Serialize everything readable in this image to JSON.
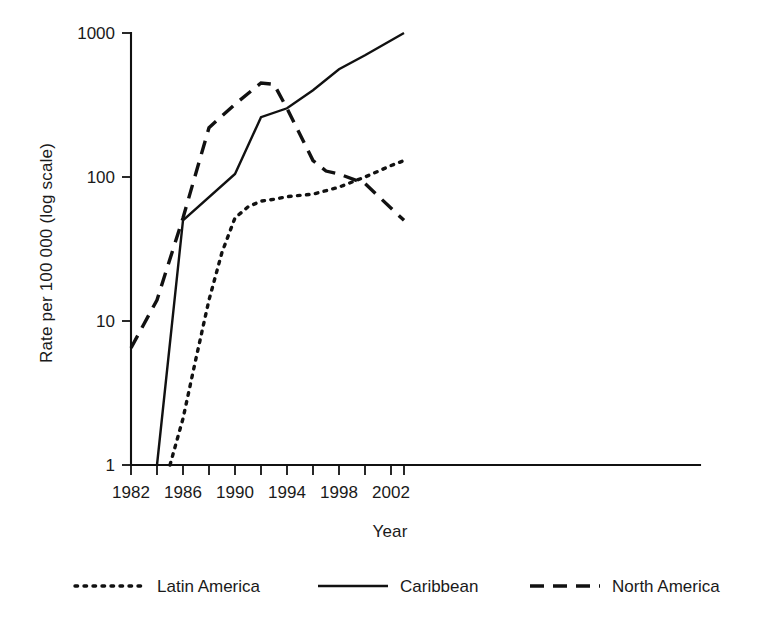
{
  "chart_data": {
    "type": "line",
    "title": "",
    "xlabel": "Year",
    "ylabel": "Rate per 100 000 (log scale)",
    "yscale": "log",
    "ylim": [
      1,
      1000
    ],
    "xlim": [
      1982,
      2003
    ],
    "grid": false,
    "legend_position": "bottom",
    "ytick_labels": [
      "1000",
      "100",
      "10",
      "1"
    ],
    "ytick_values": [
      1000,
      100,
      10,
      1
    ],
    "xtick_labels": [
      "1982",
      "1986",
      "1990",
      "1994",
      "1998",
      "2002"
    ],
    "xtick_values": [
      1982,
      1986,
      1990,
      1994,
      1998,
      2002
    ],
    "xtick_minor_values": [
      1984,
      1988,
      1992,
      1996,
      2000
    ],
    "series": [
      {
        "name": "Latin America",
        "style": "dotted",
        "x": [
          1985,
          1986,
          1987,
          1988,
          1989,
          1990,
          1991,
          1992,
          1993,
          1994,
          1996,
          1998,
          2000,
          2002,
          2003
        ],
        "values": [
          1,
          2.1,
          5.5,
          14,
          30,
          52,
          62,
          68,
          70,
          73,
          76,
          85,
          100,
          120,
          130
        ]
      },
      {
        "name": "Caribbean",
        "style": "solid",
        "x": [
          1984,
          1986,
          1990,
          1992,
          1994,
          1996,
          1998,
          2000,
          2003
        ],
        "values": [
          1,
          50,
          105,
          260,
          300,
          400,
          560,
          700,
          1000
        ]
      },
      {
        "name": "North America",
        "style": "dashed",
        "x": [
          1982,
          1984,
          1986,
          1988,
          1990,
          1992,
          1993,
          1994,
          1996,
          1997,
          1998,
          2000,
          2003
        ],
        "values": [
          6.5,
          14,
          52,
          220,
          320,
          450,
          440,
          300,
          130,
          110,
          105,
          90,
          50
        ]
      }
    ]
  },
  "legend": {
    "items": [
      {
        "label": "Latin America",
        "style": "dotted"
      },
      {
        "label": "Caribbean",
        "style": "solid"
      },
      {
        "label": "North America",
        "style": "dashed"
      }
    ]
  },
  "axes": {
    "x_title": "Year",
    "y_title": "Rate per 100 000 (log scale)"
  }
}
